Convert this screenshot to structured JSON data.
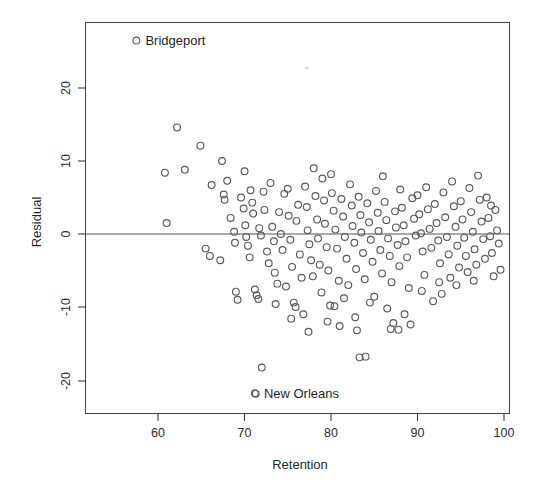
{
  "chart_data": {
    "type": "scatter",
    "title": "",
    "xlabel": "Retention",
    "ylabel": "Residual",
    "xlim": [
      53.5,
      102.0
    ],
    "ylim": [
      -27.5,
      28.5
    ],
    "xticks": [
      60,
      70,
      80,
      90,
      100
    ],
    "xtick_labels": [
      "60",
      "70",
      "80",
      "90",
      "100"
    ],
    "yticks": [
      20,
      10,
      0,
      -10,
      -20
    ],
    "ytick_labels": [
      "20",
      "10",
      "0",
      "-10",
      "-20"
    ],
    "grid": false,
    "legend": "none",
    "reference_lines": [
      {
        "orientation": "horizontal",
        "value": 0
      }
    ],
    "annotations": [
      {
        "text": "Bridgeport",
        "marker": "open-circle",
        "x": 57.5,
        "y": 26.5
      },
      {
        "text": "New Orleans",
        "marker": "open-circle",
        "x": 71.2,
        "y": -21.8
      }
    ],
    "marker_style": "open-circle",
    "marker_size": 3.4,
    "point_count": 196,
    "points": [
      [
        61.0,
        1.5
      ],
      [
        60.8,
        8.4
      ],
      [
        62.2,
        14.6
      ],
      [
        63.1,
        8.8
      ],
      [
        64.9,
        12.1
      ],
      [
        66.0,
        -3.0
      ],
      [
        67.2,
        -3.6
      ],
      [
        66.2,
        6.7
      ],
      [
        67.4,
        10.0
      ],
      [
        67.6,
        5.4
      ],
      [
        67.7,
        4.7
      ],
      [
        68.0,
        7.3
      ],
      [
        68.4,
        2.2
      ],
      [
        68.8,
        0.3
      ],
      [
        68.9,
        -1.2
      ],
      [
        69.2,
        -9.0
      ],
      [
        69.6,
        5.0
      ],
      [
        69.9,
        3.5
      ],
      [
        70.0,
        8.6
      ],
      [
        70.1,
        1.2
      ],
      [
        70.2,
        -0.4
      ],
      [
        70.4,
        -1.6
      ],
      [
        70.6,
        -3.2
      ],
      [
        70.7,
        6.0
      ],
      [
        70.9,
        4.3
      ],
      [
        71.0,
        2.8
      ],
      [
        71.2,
        -7.6
      ],
      [
        71.4,
        -8.4
      ],
      [
        71.6,
        -8.9
      ],
      [
        71.7,
        0.8
      ],
      [
        71.9,
        -0.2
      ],
      [
        72.0,
        -18.3
      ],
      [
        72.2,
        5.8
      ],
      [
        72.3,
        3.3
      ],
      [
        72.6,
        -2.4
      ],
      [
        72.8,
        -4.0
      ],
      [
        73.0,
        7.0
      ],
      [
        73.2,
        1.0
      ],
      [
        73.4,
        -1.0
      ],
      [
        73.5,
        -5.3
      ],
      [
        73.8,
        -6.8
      ],
      [
        74.0,
        3.0
      ],
      [
        74.2,
        0.0
      ],
      [
        74.4,
        -2.2
      ],
      [
        74.6,
        5.5
      ],
      [
        74.8,
        -7.2
      ],
      [
        75.0,
        6.2
      ],
      [
        75.1,
        2.5
      ],
      [
        75.3,
        -0.8
      ],
      [
        75.5,
        -4.5
      ],
      [
        75.7,
        -9.4
      ],
      [
        75.9,
        -10.0
      ],
      [
        76.0,
        1.8
      ],
      [
        76.2,
        4.0
      ],
      [
        76.4,
        -2.8
      ],
      [
        76.6,
        -6.0
      ],
      [
        76.8,
        -11.0
      ],
      [
        77.0,
        6.5
      ],
      [
        77.2,
        3.7
      ],
      [
        77.3,
        0.5
      ],
      [
        77.5,
        -1.4
      ],
      [
        77.7,
        -3.6
      ],
      [
        77.9,
        -5.8
      ],
      [
        78.0,
        9.0
      ],
      [
        78.2,
        5.2
      ],
      [
        78.4,
        2.0
      ],
      [
        78.5,
        -0.6
      ],
      [
        78.7,
        -4.2
      ],
      [
        78.9,
        -8.0
      ],
      [
        79.0,
        7.6
      ],
      [
        79.2,
        4.6
      ],
      [
        79.3,
        1.4
      ],
      [
        79.5,
        -1.8
      ],
      [
        79.7,
        -5.0
      ],
      [
        79.9,
        -9.8
      ],
      [
        80.0,
        8.2
      ],
      [
        80.1,
        5.6
      ],
      [
        80.3,
        3.2
      ],
      [
        80.5,
        0.6
      ],
      [
        80.7,
        -2.0
      ],
      [
        80.9,
        -6.4
      ],
      [
        81.0,
        -12.6
      ],
      [
        81.2,
        4.8
      ],
      [
        81.4,
        2.4
      ],
      [
        81.6,
        -0.4
      ],
      [
        81.8,
        -3.4
      ],
      [
        82.0,
        -7.0
      ],
      [
        82.2,
        6.8
      ],
      [
        82.4,
        3.9
      ],
      [
        82.5,
        1.1
      ],
      [
        82.7,
        -1.2
      ],
      [
        82.9,
        -4.8
      ],
      [
        83.0,
        -13.2
      ],
      [
        83.2,
        5.1
      ],
      [
        83.4,
        2.6
      ],
      [
        83.5,
        0.2
      ],
      [
        83.7,
        -2.6
      ],
      [
        83.9,
        -6.2
      ],
      [
        84.0,
        -16.8
      ],
      [
        84.2,
        4.2
      ],
      [
        84.4,
        1.6
      ],
      [
        84.6,
        -0.8
      ],
      [
        84.8,
        -3.8
      ],
      [
        85.0,
        -8.6
      ],
      [
        85.2,
        5.9
      ],
      [
        85.4,
        2.9
      ],
      [
        85.5,
        0.4
      ],
      [
        85.7,
        -2.2
      ],
      [
        85.9,
        -5.4
      ],
      [
        86.0,
        7.9
      ],
      [
        86.2,
        4.4
      ],
      [
        86.4,
        1.9
      ],
      [
        86.6,
        -0.6
      ],
      [
        86.8,
        -3.0
      ],
      [
        87.0,
        -6.6
      ],
      [
        87.2,
        -12.2
      ],
      [
        87.4,
        3.1
      ],
      [
        87.5,
        0.9
      ],
      [
        87.7,
        -1.5
      ],
      [
        87.9,
        -4.4
      ],
      [
        88.0,
        6.1
      ],
      [
        88.2,
        3.6
      ],
      [
        88.4,
        1.2
      ],
      [
        88.6,
        -1.0
      ],
      [
        88.8,
        -3.2
      ],
      [
        89.0,
        -7.4
      ],
      [
        89.2,
        -12.4
      ],
      [
        89.4,
        4.9
      ],
      [
        89.6,
        2.1
      ],
      [
        89.8,
        -0.2
      ],
      [
        90.0,
        5.3
      ],
      [
        90.2,
        2.7
      ],
      [
        90.4,
        0.1
      ],
      [
        90.6,
        -2.4
      ],
      [
        90.8,
        -5.6
      ],
      [
        91.0,
        6.4
      ],
      [
        91.2,
        3.4
      ],
      [
        91.4,
        0.7
      ],
      [
        91.6,
        -1.9
      ],
      [
        91.8,
        -9.2
      ],
      [
        92.0,
        4.1
      ],
      [
        92.2,
        1.5
      ],
      [
        92.4,
        -0.9
      ],
      [
        92.6,
        -4.0
      ],
      [
        92.8,
        -8.2
      ],
      [
        93.0,
        5.7
      ],
      [
        93.2,
        2.3
      ],
      [
        93.4,
        -0.4
      ],
      [
        93.6,
        -2.8
      ],
      [
        93.8,
        -6.0
      ],
      [
        94.0,
        7.2
      ],
      [
        94.2,
        3.8
      ],
      [
        94.4,
        1.0
      ],
      [
        94.6,
        -1.6
      ],
      [
        94.8,
        -4.6
      ],
      [
        95.0,
        4.5
      ],
      [
        95.2,
        2.0
      ],
      [
        95.4,
        -0.5
      ],
      [
        95.6,
        -3.0
      ],
      [
        95.8,
        -5.2
      ],
      [
        96.0,
        6.3
      ],
      [
        96.2,
        3.0
      ],
      [
        96.4,
        0.3
      ],
      [
        96.6,
        -2.1
      ],
      [
        96.8,
        -4.2
      ],
      [
        97.0,
        8.0
      ],
      [
        97.2,
        4.7
      ],
      [
        97.4,
        1.7
      ],
      [
        97.6,
        -0.7
      ],
      [
        97.8,
        -3.4
      ],
      [
        98.0,
        5.0
      ],
      [
        98.2,
        2.2
      ],
      [
        98.4,
        -0.3
      ],
      [
        98.6,
        -2.6
      ],
      [
        98.8,
        -5.8
      ],
      [
        99.0,
        3.3
      ],
      [
        99.2,
        0.5
      ],
      [
        99.4,
        -1.3
      ],
      [
        99.6,
        -4.9
      ],
      [
        98.5,
        3.9
      ],
      [
        65.5,
        -2.0
      ],
      [
        69.0,
        -7.9
      ],
      [
        73.6,
        -9.6
      ],
      [
        77.4,
        -13.4
      ],
      [
        81.5,
        -8.8
      ],
      [
        84.5,
        -9.4
      ],
      [
        86.5,
        -10.2
      ],
      [
        88.5,
        -11.0
      ],
      [
        90.5,
        -7.8
      ],
      [
        92.5,
        -6.6
      ],
      [
        94.5,
        -7.0
      ],
      [
        96.5,
        -6.4
      ],
      [
        82.8,
        -11.4
      ],
      [
        79.6,
        -12.0
      ],
      [
        75.4,
        -11.6
      ],
      [
        86.9,
        -13.0
      ],
      [
        87.8,
        -13.1
      ],
      [
        83.3,
        -16.9
      ],
      [
        71.3,
        -21.9
      ],
      [
        80.4,
        -9.9
      ]
    ]
  },
  "axis_titles": {
    "x": "Retention",
    "y": "Residual"
  }
}
